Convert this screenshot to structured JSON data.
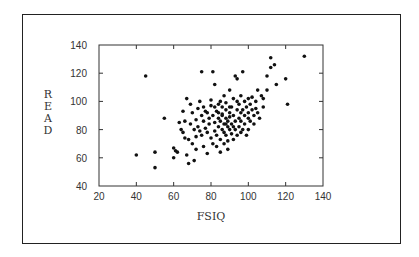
{
  "chart_data": {
    "type": "scatter",
    "title": "",
    "xlabel": "FSIQ",
    "ylabel": "READ",
    "xlim": [
      20,
      140
    ],
    "ylim": [
      40,
      140
    ],
    "xticks": [
      20,
      40,
      60,
      80,
      100,
      120,
      140
    ],
    "yticks": [
      40,
      60,
      80,
      100,
      120,
      140
    ],
    "grid": false,
    "legend": null,
    "marker_color": "#111111",
    "points": [
      [
        40,
        62
      ],
      [
        45,
        118
      ],
      [
        50,
        64
      ],
      [
        50,
        53
      ],
      [
        55,
        88
      ],
      [
        60,
        67
      ],
      [
        60,
        60
      ],
      [
        61,
        65
      ],
      [
        62,
        64
      ],
      [
        63,
        85
      ],
      [
        64,
        80
      ],
      [
        65,
        93
      ],
      [
        65,
        78
      ],
      [
        66,
        86
      ],
      [
        67,
        102
      ],
      [
        67,
        62
      ],
      [
        68,
        73
      ],
      [
        68,
        56
      ],
      [
        69,
        98
      ],
      [
        69,
        84
      ],
      [
        70,
        70
      ],
      [
        70,
        92
      ],
      [
        71,
        80
      ],
      [
        71,
        58
      ],
      [
        72,
        87
      ],
      [
        72,
        75
      ],
      [
        73,
        82
      ],
      [
        73,
        95
      ],
      [
        74,
        79
      ],
      [
        74,
        100
      ],
      [
        75,
        121
      ],
      [
        75,
        76
      ],
      [
        75,
        90
      ],
      [
        76,
        86
      ],
      [
        76,
        68
      ],
      [
        77,
        81
      ],
      [
        77,
        93
      ],
      [
        78,
        78
      ],
      [
        78,
        63
      ],
      [
        79,
        88
      ],
      [
        79,
        84
      ],
      [
        80,
        101
      ],
      [
        80,
        74
      ],
      [
        80,
        97
      ],
      [
        81,
        121
      ],
      [
        81,
        90
      ],
      [
        81,
        70
      ],
      [
        82,
        85
      ],
      [
        82,
        79
      ],
      [
        82,
        112
      ],
      [
        83,
        93
      ],
      [
        83,
        76
      ],
      [
        83,
        68
      ],
      [
        84,
        98
      ],
      [
        84,
        88
      ],
      [
        84,
        82
      ],
      [
        85,
        86
      ],
      [
        85,
        100
      ],
      [
        85,
        73
      ],
      [
        85,
        64
      ],
      [
        86,
        91
      ],
      [
        86,
        80
      ],
      [
        86,
        96
      ],
      [
        87,
        84
      ],
      [
        87,
        78
      ],
      [
        87,
        70
      ],
      [
        87,
        104
      ],
      [
        88,
        88
      ],
      [
        88,
        94
      ],
      [
        88,
        76
      ],
      [
        88,
        99
      ],
      [
        89,
        82
      ],
      [
        89,
        86
      ],
      [
        89,
        72
      ],
      [
        89,
        66
      ],
      [
        90,
        92
      ],
      [
        90,
        80
      ],
      [
        90,
        89
      ],
      [
        90,
        108
      ],
      [
        91,
        84
      ],
      [
        91,
        77
      ],
      [
        91,
        96
      ],
      [
        92,
        90
      ],
      [
        92,
        73
      ],
      [
        92,
        102
      ],
      [
        93,
        86
      ],
      [
        93,
        80
      ],
      [
        93,
        118
      ],
      [
        94,
        94
      ],
      [
        94,
        116
      ],
      [
        94,
        76
      ],
      [
        95,
        88
      ],
      [
        95,
        98
      ],
      [
        95,
        82
      ],
      [
        96,
        92
      ],
      [
        96,
        86
      ],
      [
        96,
        104
      ],
      [
        97,
        80
      ],
      [
        97,
        94
      ],
      [
        97,
        121
      ],
      [
        98,
        90
      ],
      [
        98,
        100
      ],
      [
        98,
        84
      ],
      [
        99,
        96
      ],
      [
        99,
        76
      ],
      [
        100,
        88
      ],
      [
        100,
        102
      ],
      [
        100,
        92
      ],
      [
        101,
        86
      ],
      [
        101,
        98
      ],
      [
        102,
        94
      ],
      [
        102,
        103
      ],
      [
        103,
        90
      ],
      [
        103,
        84
      ],
      [
        104,
        100
      ],
      [
        104,
        95
      ],
      [
        105,
        108
      ],
      [
        105,
        92
      ],
      [
        106,
        88
      ],
      [
        107,
        104
      ],
      [
        108,
        102
      ],
      [
        108,
        96
      ],
      [
        110,
        118
      ],
      [
        110,
        108
      ],
      [
        112,
        124
      ],
      [
        112,
        131
      ],
      [
        114,
        126
      ],
      [
        115,
        112
      ],
      [
        120,
        116
      ],
      [
        121,
        98
      ],
      [
        130,
        132
      ],
      [
        86,
        90
      ],
      [
        88,
        84
      ],
      [
        90,
        96
      ],
      [
        84,
        92
      ],
      [
        92,
        82
      ],
      [
        76,
        96
      ],
      [
        78,
        92
      ],
      [
        66,
        74
      ],
      [
        72,
        66
      ],
      [
        94,
        100
      ],
      [
        96,
        78
      ],
      [
        100,
        80
      ],
      [
        82,
        96
      ]
    ]
  }
}
